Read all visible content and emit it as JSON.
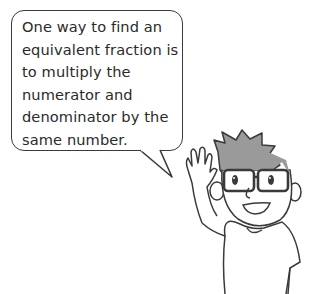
{
  "speech_bubble": {
    "lines": [
      "One way to find an",
      "equivalent fraction is",
      "to multiply the",
      "numerator and",
      "denominator by the",
      "same number."
    ]
  },
  "character": {
    "description": "boy with glasses waving",
    "hair_color": "#9a9a9a",
    "line_color": "#3a3a3a"
  }
}
